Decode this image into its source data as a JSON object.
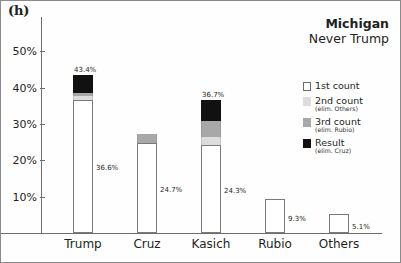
{
  "panel_tag": "(h)",
  "header": {
    "title": "Michigan",
    "subtitle": "Never Trump"
  },
  "legend": {
    "items": [
      {
        "label": "1st count",
        "sub": "",
        "swatch": "#ffffff",
        "border": "#6d6d6d"
      },
      {
        "label": "2nd count",
        "sub": "(elim. Others)",
        "swatch": "#dcdcdc",
        "border": "#dcdcdc"
      },
      {
        "label": "3rd count",
        "sub": "(elim. Rubio)",
        "swatch": "#a8a8a8",
        "border": "#a8a8a8"
      },
      {
        "label": "Result",
        "sub": "(elim. Cruz)",
        "swatch": "#111111",
        "border": "#111111"
      }
    ]
  },
  "chart_data": {
    "type": "bar",
    "title": "Michigan",
    "subtitle": "Never Trump",
    "xlabel": "",
    "ylabel": "",
    "ylim": [
      0,
      55
    ],
    "grid": false,
    "stacked": true,
    "legend_position": "right",
    "yticks": [
      10,
      20,
      30,
      40,
      50
    ],
    "ytick_labels": [
      "10%",
      "20%",
      "30%",
      "40%",
      "50%"
    ],
    "categories": [
      "Trump",
      "Cruz",
      "Kasich",
      "Rubio",
      "Others"
    ],
    "series": [
      {
        "name": "1st count",
        "values": [
          36.6,
          24.7,
          24.3,
          9.3,
          5.1
        ]
      },
      {
        "name": "2nd count (elim. Others)",
        "values": [
          37.6,
          24.7,
          26.3,
          null,
          null
        ]
      },
      {
        "name": "3rd count (elim. Rubio)",
        "values": [
          38.6,
          27.2,
          30.8,
          null,
          null
        ]
      },
      {
        "name": "Result (elim. Cruz)",
        "values": [
          43.4,
          null,
          36.7,
          null,
          null
        ]
      }
    ],
    "value_labels": {
      "first_count": [
        "36.6%",
        "24.7%",
        "24.3%",
        "9.3%",
        "5.1%"
      ],
      "totals": [
        "43.4%",
        "",
        "36.7%",
        "",
        ""
      ]
    }
  }
}
